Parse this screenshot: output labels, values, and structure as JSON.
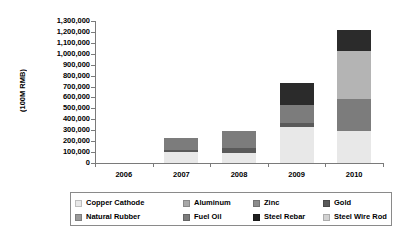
{
  "chart_data": {
    "type": "bar",
    "stacked": true,
    "title": "",
    "xlabel": "",
    "ylabel": "(100M RMB)",
    "categories": [
      "2006",
      "2007",
      "2008",
      "2009",
      "2010"
    ],
    "ylim": [
      0,
      1300000
    ],
    "ytick_step": 100000,
    "ytick_labels": [
      "1,300,000",
      "1,200,000",
      "1,100,000",
      "1,000,000",
      "900,000",
      "800,000",
      "700,000",
      "600,000",
      "500,000",
      "400,000",
      "300,000",
      "200,000",
      "100,000",
      "0"
    ],
    "grid": false,
    "legend_position": "bottom",
    "series": [
      {
        "name": "Copper Cathode",
        "color": "#e8e8e8",
        "values": [
          0,
          100000,
          95000,
          330000,
          295000
        ]
      },
      {
        "name": "Aluminum",
        "color": "#a8a8a8",
        "values": [
          0,
          0,
          0,
          0,
          0
        ]
      },
      {
        "name": "Zinc",
        "color": "#8c8c8c",
        "values": [
          0,
          0,
          0,
          0,
          0
        ]
      },
      {
        "name": "Gold",
        "color": "#5a5a5a",
        "values": [
          0,
          20000,
          40000,
          40000,
          0
        ]
      },
      {
        "name": "Natural Rubber",
        "color": "#9a9a9a",
        "values": [
          0,
          0,
          0,
          0,
          0
        ]
      },
      {
        "name": "Fuel Oil",
        "color": "#7c7c7c",
        "values": [
          0,
          110000,
          155000,
          165000,
          295000
        ]
      },
      {
        "name": "Steel Rebar",
        "color": "#2b2b2b",
        "values": [
          0,
          0,
          0,
          195000,
          190000
        ]
      },
      {
        "name": "Steel Wire Rod",
        "color": "#b4b4b4",
        "values": [
          0,
          0,
          0,
          0,
          440000
        ]
      }
    ],
    "totals": [
      0,
      230000,
      290000,
      730000,
      1220000
    ],
    "stack_order": [
      "Copper Cathode",
      "Gold",
      "Fuel Oil",
      "Steel Wire Rod",
      "Steel Rebar"
    ]
  },
  "legend": {
    "rows": [
      [
        {
          "label": "Copper Cathode",
          "color": "#e8e8e8"
        },
        {
          "label": "Aluminum",
          "color": "#a8a8a8"
        },
        {
          "label": "Zinc",
          "color": "#8c8c8c"
        },
        {
          "label": "Gold",
          "color": "#5a5a5a"
        }
      ],
      [
        {
          "label": "Natural Rubber",
          "color": "#9a9a9a"
        },
        {
          "label": "Fuel Oil",
          "color": "#7c7c7c"
        },
        {
          "label": "Steel Rebar",
          "color": "#1f1f1f"
        },
        {
          "label": "Steel Wire Rod",
          "color": "#d2d2d2"
        }
      ]
    ]
  },
  "colors": {
    "axis": "#7a7a7a",
    "text": "#000000",
    "background": "#ffffff",
    "legend_border": "#8a8a8a"
  }
}
